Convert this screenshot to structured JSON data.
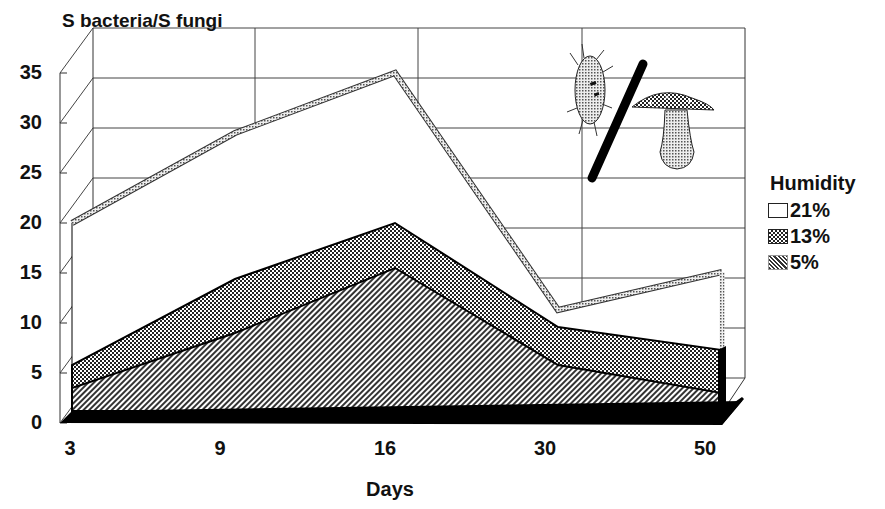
{
  "chart_data": {
    "type": "area",
    "style": "3d-overlapping-area",
    "title": "S bacteria/S fungi",
    "xlabel": "Days",
    "ylabel": "S bacteria/S fungi",
    "categories": [
      "3",
      "9",
      "16",
      "30",
      "50"
    ],
    "yticks": [
      "0",
      "5",
      "10",
      "15",
      "20",
      "25",
      "30",
      "35"
    ],
    "ylim": [
      0,
      35
    ],
    "grid": true,
    "legend_title": "Humidity",
    "legend_position": "right",
    "series": [
      {
        "name": "21%",
        "values": [
          20,
          29,
          35,
          11.3,
          15.1
        ],
        "fill": "#ffffff",
        "pattern": "white"
      },
      {
        "name": "13%",
        "values": [
          5.8,
          14.4,
          20,
          9.6,
          7.3
        ],
        "fill": "#555555",
        "pattern": "checker"
      },
      {
        "name": "5%",
        "values": [
          3.5,
          9,
          15.5,
          5.8,
          3
        ],
        "fill": "#aaaaaa",
        "pattern": "diagonal"
      }
    ],
    "annotation": "illustration: bacterium / mushroom (bacteria divided by fungi)"
  },
  "legend": {
    "title": "Humidity",
    "items": [
      {
        "label": "21%"
      },
      {
        "label": "13%"
      },
      {
        "label": "5%"
      }
    ]
  }
}
